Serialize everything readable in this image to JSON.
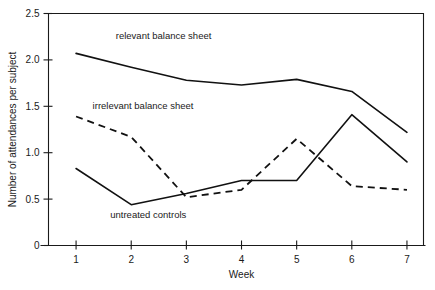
{
  "chart_data": {
    "type": "line",
    "title": "",
    "xlabel": "Week",
    "ylabel": "Number of attendances per subject",
    "x": [
      1,
      2,
      3,
      4,
      5,
      6,
      7
    ],
    "xtick_labels": [
      "1",
      "2",
      "3",
      "4",
      "5",
      "6",
      "7"
    ],
    "ytick_labels": [
      "0",
      "0.5",
      "1.0",
      "1.5",
      "2.0",
      "2.5"
    ],
    "ytick_values": [
      0,
      0.5,
      1.0,
      1.5,
      2.0,
      2.5
    ],
    "xlim": [
      0.5,
      7.3
    ],
    "ylim": [
      0,
      2.5
    ],
    "grid": false,
    "legend": "inline-annotations",
    "series": [
      {
        "name": "relevant balance sheet",
        "style": "solid",
        "label_text": "relevant balance sheet",
        "values": [
          2.07,
          1.92,
          1.78,
          1.73,
          1.79,
          1.66,
          1.22
        ]
      },
      {
        "name": "irrelevant balance sheet",
        "style": "dashed",
        "label_text": "irrelevant balance sheet",
        "values": [
          1.39,
          1.17,
          0.52,
          0.6,
          1.15,
          0.64,
          0.6
        ]
      },
      {
        "name": "untreated controls",
        "style": "solid",
        "label_text": "untreated controls",
        "values": [
          0.83,
          0.44,
          0.56,
          0.7,
          0.7,
          1.41,
          0.9
        ]
      }
    ],
    "annotations": [
      {
        "text": "relevant balance sheet",
        "x": 1.72,
        "y": 2.23
      },
      {
        "text": "irrelevant balance sheet",
        "x": 1.3,
        "y": 1.47
      },
      {
        "text": "untreated controls",
        "x": 1.62,
        "y": 0.3
      }
    ]
  }
}
